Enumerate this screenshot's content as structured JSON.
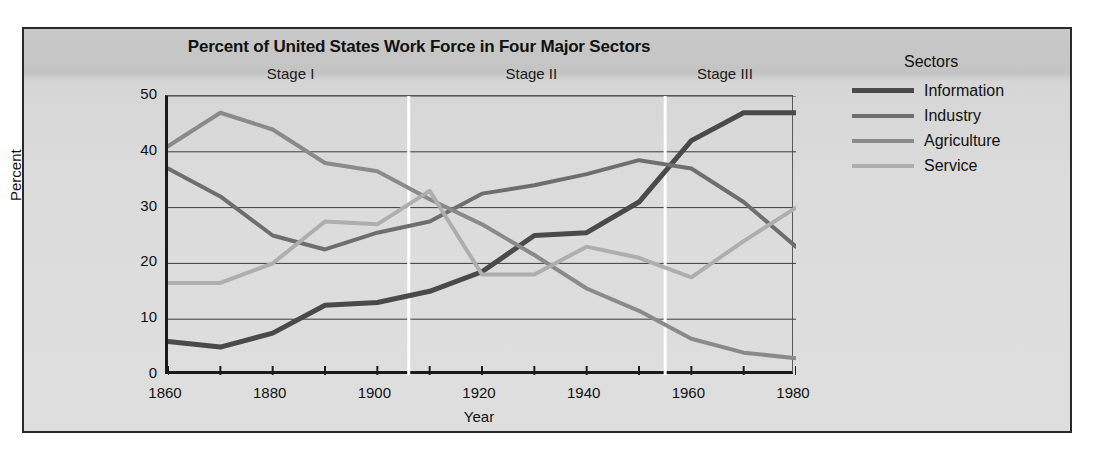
{
  "figure": {
    "title": "Percent of United States Work Force in Four Major Sectors",
    "xtitle": "Year",
    "ytitle": "Percent"
  },
  "stages": [
    {
      "label": "Stage I",
      "center_year": 1884
    },
    {
      "label": "Stage II",
      "center_year": 1930
    },
    {
      "label": "Stage III",
      "center_year": 1967
    }
  ],
  "legend": {
    "title": "Sectors",
    "items": [
      {
        "label": "Information",
        "color": "#4a4a4a",
        "width": 5
      },
      {
        "label": "Industry",
        "color": "#6e6e6e",
        "width": 4
      },
      {
        "label": "Agriculture",
        "color": "#8a8a8a",
        "width": 4
      },
      {
        "label": "Service",
        "color": "#aeaeae",
        "width": 4
      }
    ]
  },
  "chart_data": {
    "type": "line",
    "title": "Percent of United States Work Force in Four Major Sectors",
    "xlabel": "Year",
    "ylabel": "Percent",
    "xlim": [
      1860,
      1980
    ],
    "ylim": [
      0,
      50
    ],
    "xticks": [
      1860,
      1870,
      1880,
      1890,
      1900,
      1910,
      1920,
      1930,
      1940,
      1950,
      1960,
      1970,
      1980
    ],
    "xticklabels": [
      "1860",
      "",
      "1880",
      "",
      "1900",
      "",
      "1920",
      "",
      "1940",
      "",
      "1960",
      "",
      "1980"
    ],
    "yticks": [
      0,
      10,
      20,
      30,
      40,
      50
    ],
    "yticklabels": [
      "0",
      "10",
      "20",
      "30",
      "40",
      "50"
    ],
    "grid": "horizontal",
    "legend_position": "right",
    "x": [
      1860,
      1870,
      1880,
      1890,
      1900,
      1910,
      1920,
      1930,
      1940,
      1950,
      1960,
      1970,
      1980
    ],
    "series": [
      {
        "name": "Information",
        "color": "#4a4a4a",
        "values": [
          6,
          5,
          7.5,
          12.5,
          13,
          15,
          18.5,
          25,
          25.5,
          31,
          42,
          47,
          47
        ]
      },
      {
        "name": "Industry",
        "color": "#6e6e6e",
        "values": [
          37,
          32,
          25,
          22.5,
          25.5,
          27.5,
          32.5,
          34,
          36,
          38.5,
          37,
          31,
          23
        ]
      },
      {
        "name": "Agriculture",
        "color": "#8a8a8a",
        "values": [
          41,
          47,
          44,
          38,
          36.5,
          31.5,
          27,
          21.5,
          15.5,
          11.5,
          6.5,
          4,
          3
        ]
      },
      {
        "name": "Service",
        "color": "#aeaeae",
        "values": [
          16.5,
          16.5,
          20,
          27.5,
          27,
          33,
          18,
          18,
          23,
          21,
          17.5,
          24,
          30
        ]
      }
    ],
    "stage_dividers": [
      1906,
      1955
    ],
    "annotations": [
      "Stage I",
      "Stage II",
      "Stage III"
    ]
  }
}
